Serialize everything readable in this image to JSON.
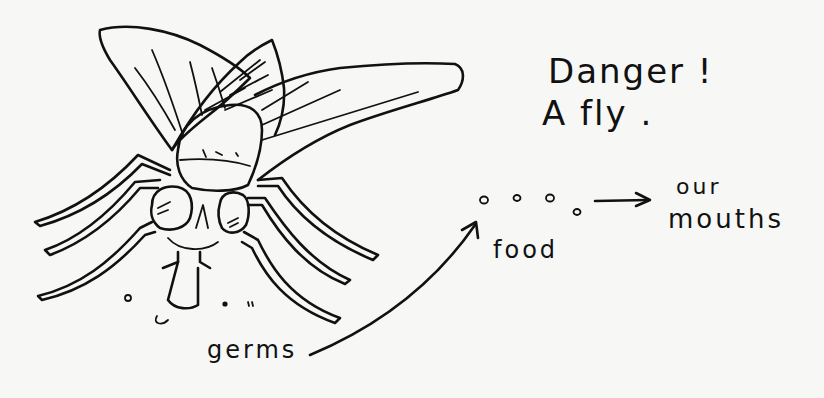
{
  "diagram": {
    "title_lines": [
      "Danger !",
      "A fly ."
    ],
    "labels": {
      "food": "food",
      "our": "our",
      "mouths": "mouths",
      "germs": "germs"
    },
    "flow": [
      {
        "from": "germs",
        "to": "food",
        "connector": "curved-arrow"
      },
      {
        "from": "food",
        "to": "our mouths",
        "connector": "straight-arrow"
      }
    ],
    "colors": {
      "ink": "#111111",
      "paper": "#f7f7f5"
    }
  }
}
